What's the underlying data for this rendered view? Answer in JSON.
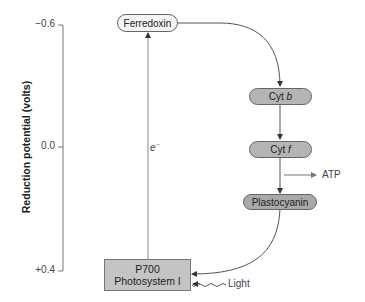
{
  "diagram": {
    "y_axis": {
      "label": "Reduction potential (volts)",
      "ticks": [
        {
          "label": "−0.6",
          "value": -0.6
        },
        {
          "label": "0.0",
          "value": 0.0
        },
        {
          "label": "+0.4",
          "value": 0.4
        }
      ]
    },
    "nodes": {
      "ferredoxin": {
        "label": "Ferredoxin",
        "style": "light-pill"
      },
      "cyt_b": {
        "prefix": "Cyt ",
        "italic": "b",
        "style": "gray-pill"
      },
      "cyt_f": {
        "prefix": "Cyt ",
        "italic": "f",
        "style": "gray-pill"
      },
      "plastocyanin": {
        "label": "Plastocyanin",
        "style": "gray-pill"
      },
      "p700": {
        "line1": "P700",
        "line2": "Photosystem I",
        "style": "gray-box"
      }
    },
    "annotations": {
      "electron": "e",
      "electron_charge": "−",
      "atp": "ATP",
      "light": "Light"
    },
    "edges": [
      {
        "from": "P700",
        "to": "Ferredoxin",
        "label": "e−"
      },
      {
        "from": "Ferredoxin",
        "to": "Cyt b"
      },
      {
        "from": "Cyt b",
        "to": "Cyt f"
      },
      {
        "from": "Cyt f",
        "to": "ATP",
        "type": "side-output"
      },
      {
        "from": "Cyt f",
        "to": "Plastocyanin"
      },
      {
        "from": "Plastocyanin",
        "to": "P700"
      },
      {
        "from": "Light",
        "to": "P700"
      }
    ]
  }
}
